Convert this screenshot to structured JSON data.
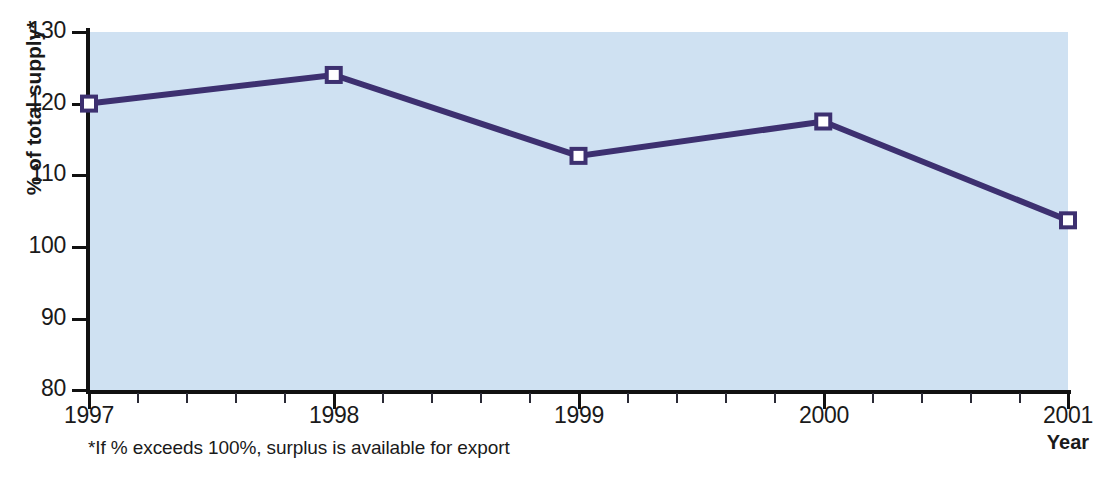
{
  "chart_data": {
    "type": "line",
    "title": "",
    "xlabel": "Year",
    "ylabel": "% of total supply*",
    "categories": [
      "1997",
      "1998",
      "1999",
      "2000",
      "2001"
    ],
    "x": [
      1997,
      1998,
      1999,
      2000,
      2001
    ],
    "values": [
      120,
      124,
      112.7,
      117.5,
      103.7
    ],
    "series": [
      {
        "name": "% of total supply",
        "values": [
          120,
          124,
          112.7,
          117.5,
          103.7
        ]
      }
    ],
    "ylim": [
      80,
      130
    ],
    "xlim": [
      1997,
      2001
    ],
    "yticks": [
      130,
      120,
      110,
      100,
      90,
      80
    ],
    "ytick_labels": [
      "130",
      "120",
      "110",
      "100",
      "90",
      "80"
    ],
    "xticks": [
      1997,
      1998,
      1999,
      2000,
      2001
    ],
    "xtick_labels": [
      "1997",
      "1998",
      "1999",
      "2000",
      "2001"
    ],
    "x_minor_ticks_per_interval": 5,
    "grid": false,
    "legend": "none",
    "marker": "square-open",
    "annotations": [
      "*If % exceeds 100%, surplus is available for export"
    ]
  },
  "axes": {
    "y_title": "% of total supply*",
    "x_title": "Year",
    "y_tick_labels": [
      "130",
      "120",
      "110",
      "100",
      "90",
      "80"
    ],
    "x_tick_labels": [
      "1997",
      "1998",
      "1999",
      "2000",
      "2001"
    ]
  },
  "footnote": {
    "text": "*If % exceeds 100%, surplus is available for export"
  },
  "colors": {
    "plot_background": "#cfe1f2",
    "series_line": "#3d3070",
    "marker_fill": "#ffffff",
    "marker_stroke": "#3d3070",
    "axis": "#111111",
    "text": "#1a1a1a",
    "page_background": "#ffffff"
  }
}
